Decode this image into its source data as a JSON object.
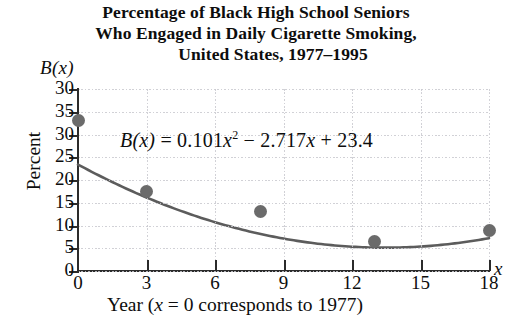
{
  "title": {
    "line1": "Percentage of Black High School Seniors",
    "line2": "Who Engaged in Daily Cigarette Smoking,",
    "line3": "United States, 1977–1995"
  },
  "axes": {
    "function_label": "B(x)",
    "y_title": "Percent",
    "x_variable": "x",
    "x_caption_prefix": "Year (",
    "x_caption_var": "x",
    "x_caption_suffix": " = 0 corresponds to 1977)",
    "y_ticks": [
      "30",
      "35",
      "30",
      "25",
      "20",
      "15",
      "10",
      "5",
      "0"
    ],
    "x_ticks": [
      "0",
      "3",
      "6",
      "9",
      "12",
      "15",
      "18"
    ]
  },
  "equation": {
    "lhs": "B(x)",
    "equals": "=",
    "a": "0.101",
    "a_var": "x",
    "a_exp": "2",
    "minus": "−",
    "b": "2.717",
    "b_var": "x",
    "plus": "+",
    "c": "23.4",
    "full": "B(x) = 0.101x² − 2.717x + 23.4"
  },
  "colors": {
    "axis": "#2b2b2b",
    "curve": "#5c5c5c",
    "point": "#6b6b6b",
    "grid": "#c9c9cf",
    "text": "#0d0d0d",
    "background": "#ffffff"
  },
  "chart_data": {
    "type": "scatter",
    "title": "Percentage of Black High School Seniors Who Engaged in Daily Cigarette Smoking, United States, 1977–1995",
    "xlabel": "Year (x = 0 corresponds to 1977)",
    "ylabel": "Percent",
    "xlim": [
      0,
      18
    ],
    "ylim": [
      0,
      40
    ],
    "xticks": [
      0,
      3,
      6,
      9,
      12,
      15,
      18
    ],
    "yticks": [
      0,
      5,
      10,
      15,
      20,
      25,
      30,
      35,
      40
    ],
    "ytick_labels_as_printed": [
      "0",
      "5",
      "10",
      "15",
      "20",
      "25",
      "30",
      "35",
      "30"
    ],
    "grid": true,
    "legend": null,
    "points": [
      {
        "x": 0,
        "y": 33
      },
      {
        "x": 3,
        "y": 17.5
      },
      {
        "x": 8,
        "y": 13
      },
      {
        "x": 13,
        "y": 6.5
      },
      {
        "x": 18,
        "y": 9
      }
    ],
    "series": [
      {
        "name": "Daily cigarette smoking (%)",
        "kind": "scatter",
        "x": [
          0,
          3,
          8,
          13,
          18
        ],
        "values": [
          33,
          17.5,
          13,
          6.5,
          9
        ]
      },
      {
        "name": "Quadratic regression B(x) = 0.101x² − 2.717x + 23.4",
        "kind": "line",
        "coefficients": {
          "a": 0.101,
          "b": -2.717,
          "c": 23.4
        },
        "x": [
          0,
          2,
          4,
          6,
          8,
          10,
          12,
          14,
          16,
          18
        ],
        "values": [
          23.4,
          18.37,
          14.15,
          10.73,
          8.12,
          6.33,
          5.34,
          5.15,
          5.78,
          7.21
        ]
      }
    ],
    "annotations": [
      {
        "text": "B(x) = 0.101x² − 2.717x + 23.4",
        "x": 2.2,
        "y": 27.5
      }
    ]
  }
}
